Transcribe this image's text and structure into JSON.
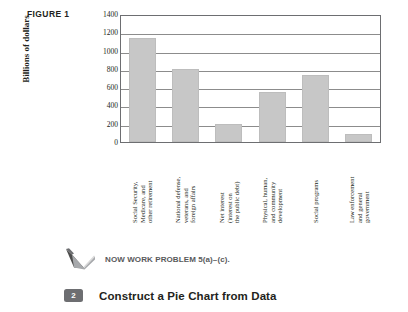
{
  "figure": {
    "label": "FIGURE 1"
  },
  "chart_data": {
    "type": "bar",
    "title": "",
    "xlabel": "",
    "ylabel": "Billions of dollars",
    "ylim": [
      0,
      1400
    ],
    "yticks": [
      1400,
      1200,
      1000,
      800,
      600,
      400,
      200,
      0
    ],
    "grid": true,
    "legend": "none",
    "bar_color": "#c7c7c7",
    "categories": [
      "Social Security,\nMedicare, and\nother retirement",
      "National defense,\nveterans, and\nforeign affairs",
      "Net interest\n(interest on\nthe public debt)",
      "Physical, human,\nand community\ndevelopment",
      "Social programs",
      "Law enforcement\nand general\ngovernment"
    ],
    "values": [
      1140,
      800,
      195,
      550,
      730,
      85
    ]
  },
  "now_work": {
    "icon": "pencil-check-icon",
    "text": "NOW WORK PROBLEM 5(a)–(c)."
  },
  "objective": {
    "number": "2",
    "title": "Construct a Pie Chart from Data"
  }
}
